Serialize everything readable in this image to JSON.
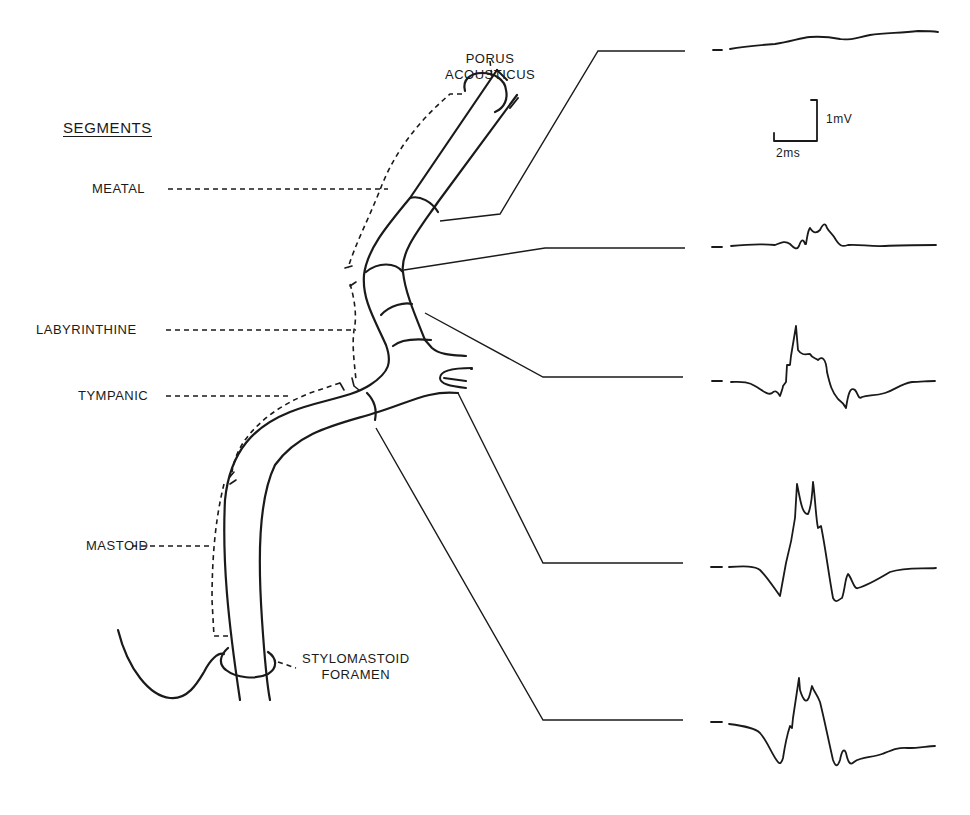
{
  "labels": {
    "header": "SEGMENTS",
    "porus_line1": "PORUS",
    "porus_line2": "ACOUSTICUS",
    "meatal": "MEATAL",
    "labyrinthine": "LABYRINTHINE",
    "tympanic": "TYMPANIC",
    "mastoid": "MASTOID",
    "stylomastoid_line1": "STYLOMASTOID",
    "stylomastoid_line2": "FORAMEN"
  },
  "scale_bar": {
    "voltage": "1mV",
    "time": "2ms"
  },
  "traces": [
    {
      "id": "trace-1",
      "recording_site": "porus acousticus / meatal",
      "description": "nearly flat, slowly rising baseline"
    },
    {
      "id": "trace-2",
      "recording_site": "meatal-labyrinthine junction",
      "description": "small polyphasic response"
    },
    {
      "id": "trace-3",
      "recording_site": "labyrinthine segment",
      "description": "sharp positive spike with notched plateau, negative trough"
    },
    {
      "id": "trace-4",
      "recording_site": "tympanic segment",
      "description": "large biphasic double-peaked response"
    },
    {
      "id": "trace-5",
      "recording_site": "mastoid segment",
      "description": "large biphasic double-peaked response"
    }
  ],
  "colors": {
    "ink": "#1a1a1a",
    "background": "#ffffff"
  }
}
